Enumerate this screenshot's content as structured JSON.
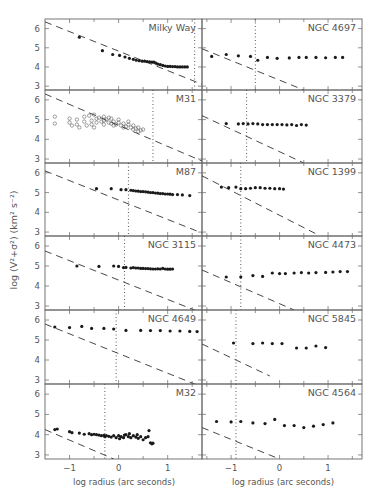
{
  "figure": {
    "ylabel": "log (V²+σ²) (km² s⁻²)",
    "xlabel": "log radius (arc seconds)",
    "frame_color": "#666666",
    "point_color": "#1a1a1a",
    "text_color": "#555555"
  },
  "chart_data": [
    {
      "type": "scatter",
      "title": "Milky Way",
      "column": 0,
      "row": 0,
      "xlim": [
        -1.5,
        1.7
      ],
      "ylim": [
        2.8,
        6.5
      ],
      "dashed_line": [
        [
          -1.5,
          6.35
        ],
        [
          1.7,
          3.1
        ]
      ],
      "dotted_x": 1.55,
      "points": [
        [
          -0.8,
          5.55
        ],
        [
          -0.33,
          4.85
        ],
        [
          -0.12,
          4.65
        ],
        [
          0.02,
          4.6
        ],
        [
          0.13,
          4.52
        ],
        [
          0.22,
          4.45
        ],
        [
          0.3,
          4.4
        ],
        [
          0.36,
          4.35
        ],
        [
          0.42,
          4.33
        ],
        [
          0.48,
          4.3
        ],
        [
          0.53,
          4.3
        ],
        [
          0.58,
          4.28
        ],
        [
          0.63,
          4.27
        ],
        [
          0.68,
          4.25
        ],
        [
          0.72,
          4.25
        ],
        [
          0.76,
          4.2
        ],
        [
          0.8,
          4.15
        ],
        [
          0.85,
          4.12
        ],
        [
          0.9,
          4.08
        ],
        [
          0.95,
          4.05
        ],
        [
          1.0,
          4.03
        ],
        [
          1.05,
          4.03
        ],
        [
          1.1,
          4.02
        ],
        [
          1.15,
          4.02
        ],
        [
          1.2,
          4.0
        ],
        [
          1.25,
          4.0
        ],
        [
          1.3,
          4.0
        ],
        [
          1.35,
          4.0
        ],
        [
          1.4,
          4.0
        ]
      ],
      "open": false
    },
    {
      "type": "scatter",
      "title": "M31",
      "column": 0,
      "row": 1,
      "xlim": [
        -1.5,
        1.7
      ],
      "ylim": [
        2.8,
        6.5
      ],
      "dashed_line": [
        [
          -1.5,
          6.3
        ],
        [
          1.7,
          2.9
        ]
      ],
      "dotted_x": 0.7,
      "points": [
        [
          -1.3,
          5.15
        ],
        [
          -1.3,
          4.8
        ],
        [
          -1.0,
          5.05
        ],
        [
          -1.0,
          4.85
        ],
        [
          -0.95,
          4.7
        ],
        [
          -0.85,
          5.0
        ],
        [
          -0.85,
          4.75
        ],
        [
          -0.8,
          4.6
        ],
        [
          -0.7,
          5.15
        ],
        [
          -0.7,
          4.9
        ],
        [
          -0.65,
          4.7
        ],
        [
          -0.6,
          5.2
        ],
        [
          -0.55,
          4.95
        ],
        [
          -0.55,
          4.75
        ],
        [
          -0.5,
          5.25
        ],
        [
          -0.45,
          5.05
        ],
        [
          -0.45,
          4.85
        ],
        [
          -0.4,
          5.1
        ],
        [
          -0.35,
          4.9
        ],
        [
          -0.3,
          5.15
        ],
        [
          -0.3,
          4.75
        ],
        [
          -0.25,
          5.0
        ],
        [
          -0.2,
          4.85
        ],
        [
          -0.15,
          5.05
        ],
        [
          -0.15,
          4.8
        ],
        [
          -0.1,
          4.9
        ],
        [
          -0.05,
          4.75
        ],
        [
          0.0,
          4.85
        ],
        [
          0.05,
          4.7
        ],
        [
          0.1,
          4.8
        ],
        [
          0.15,
          4.65
        ],
        [
          0.2,
          4.75
        ],
        [
          0.25,
          4.6
        ],
        [
          0.3,
          4.7
        ],
        [
          0.35,
          4.55
        ],
        [
          0.4,
          4.6
        ],
        [
          0.45,
          4.45
        ],
        [
          0.5,
          4.5
        ],
        [
          0.3,
          4.5
        ],
        [
          0.1,
          4.6
        ],
        [
          -0.1,
          4.7
        ],
        [
          -0.3,
          4.95
        ],
        [
          -0.5,
          4.6
        ],
        [
          0.2,
          4.9
        ],
        [
          0.0,
          5.0
        ],
        [
          -0.2,
          5.1
        ],
        [
          0.4,
          4.4
        ]
      ],
      "open": true
    },
    {
      "type": "scatter",
      "title": "M87",
      "column": 0,
      "row": 2,
      "xlim": [
        -1.5,
        1.7
      ],
      "ylim": [
        2.8,
        6.5
      ],
      "dashed_line": [
        [
          -1.5,
          6.1
        ],
        [
          1.7,
          2.95
        ]
      ],
      "dotted_x": 0.2,
      "points": [
        [
          -0.45,
          5.2
        ],
        [
          -0.15,
          5.2
        ],
        [
          0.05,
          5.15
        ],
        [
          0.15,
          5.15
        ],
        [
          0.25,
          5.12
        ],
        [
          0.3,
          5.1
        ],
        [
          0.35,
          5.08
        ],
        [
          0.4,
          5.07
        ],
        [
          0.45,
          5.05
        ],
        [
          0.5,
          5.05
        ],
        [
          0.55,
          5.04
        ],
        [
          0.6,
          5.02
        ],
        [
          0.65,
          5.0
        ],
        [
          0.7,
          5.0
        ],
        [
          0.75,
          4.98
        ],
        [
          0.8,
          4.97
        ],
        [
          0.85,
          4.95
        ],
        [
          0.9,
          4.95
        ],
        [
          0.95,
          4.93
        ],
        [
          1.0,
          4.93
        ],
        [
          1.05,
          4.92
        ],
        [
          1.1,
          4.9
        ],
        [
          1.2,
          4.9
        ],
        [
          1.3,
          4.88
        ],
        [
          1.45,
          4.85
        ]
      ],
      "open": false
    },
    {
      "type": "scatter",
      "title": "NGC 3115",
      "column": 0,
      "row": 3,
      "xlim": [
        -1.5,
        1.7
      ],
      "ylim": [
        2.8,
        6.5
      ],
      "dashed_line": [
        [
          -1.5,
          5.75
        ],
        [
          1.7,
          2.65
        ]
      ],
      "dotted_x": 0.12,
      "points": [
        [
          -0.85,
          5.0
        ],
        [
          -0.4,
          4.98
        ],
        [
          -0.1,
          5.0
        ],
        [
          0.0,
          4.98
        ],
        [
          0.1,
          4.92
        ],
        [
          0.15,
          4.93
        ],
        [
          0.25,
          4.9
        ],
        [
          0.3,
          4.92
        ],
        [
          0.35,
          4.9
        ],
        [
          0.4,
          4.9
        ],
        [
          0.45,
          4.88
        ],
        [
          0.5,
          4.88
        ],
        [
          0.55,
          4.87
        ],
        [
          0.6,
          4.87
        ],
        [
          0.65,
          4.86
        ],
        [
          0.7,
          4.85
        ],
        [
          0.75,
          4.85
        ],
        [
          0.8,
          4.86
        ],
        [
          0.85,
          4.85
        ],
        [
          0.9,
          4.88
        ],
        [
          0.95,
          4.85
        ],
        [
          1.0,
          4.84
        ],
        [
          1.05,
          4.84
        ],
        [
          1.1,
          4.85
        ]
      ],
      "open": false
    },
    {
      "type": "scatter",
      "title": "NGC 4649",
      "column": 0,
      "row": 4,
      "xlim": [
        -1.5,
        1.7
      ],
      "ylim": [
        2.8,
        6.5
      ],
      "dashed_line": [
        [
          -1.5,
          5.8
        ],
        [
          1.7,
          2.65
        ]
      ],
      "dotted_x": -0.05,
      "points": [
        [
          -1.3,
          5.65
        ],
        [
          -1.0,
          5.62
        ],
        [
          -0.75,
          5.68
        ],
        [
          -0.55,
          5.58
        ],
        [
          -0.3,
          5.58
        ],
        [
          -0.1,
          5.55
        ],
        [
          0.15,
          5.48
        ],
        [
          0.45,
          5.48
        ],
        [
          0.65,
          5.47
        ],
        [
          0.85,
          5.47
        ],
        [
          1.05,
          5.45
        ],
        [
          1.25,
          5.45
        ],
        [
          1.45,
          5.43
        ],
        [
          1.6,
          5.42
        ]
      ],
      "open": false
    },
    {
      "type": "scatter",
      "title": "M32",
      "column": 0,
      "row": 5,
      "xlim": [
        -1.5,
        1.7
      ],
      "ylim": [
        2.8,
        6.5
      ],
      "dashed_line": [
        [
          -1.5,
          4.25
        ],
        [
          -0.1,
          2.8
        ]
      ],
      "dotted_x": -0.28,
      "points": [
        [
          -1.3,
          4.25
        ],
        [
          -1.25,
          4.28
        ],
        [
          -1.0,
          4.15
        ],
        [
          -0.95,
          4.1
        ],
        [
          -0.8,
          4.08
        ],
        [
          -0.7,
          4.02
        ],
        [
          -0.6,
          4.05
        ],
        [
          -0.55,
          4.0
        ],
        [
          -0.5,
          4.02
        ],
        [
          -0.45,
          4.0
        ],
        [
          -0.4,
          3.98
        ],
        [
          -0.35,
          3.95
        ],
        [
          -0.3,
          3.97
        ],
        [
          -0.28,
          3.9
        ],
        [
          -0.25,
          3.95
        ],
        [
          -0.2,
          3.92
        ],
        [
          -0.15,
          3.88
        ],
        [
          -0.1,
          3.95
        ],
        [
          -0.05,
          3.85
        ],
        [
          0.0,
          3.95
        ],
        [
          0.02,
          3.8
        ],
        [
          0.05,
          3.9
        ],
        [
          0.1,
          3.85
        ],
        [
          0.12,
          3.98
        ],
        [
          0.15,
          4.0
        ],
        [
          0.2,
          3.9
        ],
        [
          0.22,
          4.05
        ],
        [
          0.25,
          3.85
        ],
        [
          0.3,
          3.95
        ],
        [
          0.35,
          3.88
        ],
        [
          0.38,
          4.0
        ],
        [
          0.4,
          3.82
        ],
        [
          0.45,
          3.9
        ],
        [
          0.5,
          3.75
        ],
        [
          0.55,
          3.85
        ],
        [
          0.6,
          3.9
        ],
        [
          0.62,
          4.2
        ],
        [
          0.65,
          3.6
        ],
        [
          0.68,
          3.55
        ],
        [
          0.7,
          3.58
        ]
      ],
      "open": false
    },
    {
      "type": "scatter",
      "title": "NGC 4697",
      "column": 1,
      "row": 0,
      "xlim": [
        -1.6,
        1.7
      ],
      "ylim": [
        2.8,
        6.5
      ],
      "dashed_line": [
        [
          -1.6,
          4.95
        ],
        [
          0.5,
          2.8
        ]
      ],
      "dotted_x": -0.5,
      "points": [
        [
          -1.4,
          4.55
        ],
        [
          -1.1,
          4.65
        ],
        [
          -0.85,
          4.58
        ],
        [
          -0.6,
          4.55
        ],
        [
          -0.45,
          4.35
        ],
        [
          -0.25,
          4.5
        ],
        [
          -0.05,
          4.45
        ],
        [
          0.2,
          4.47
        ],
        [
          0.4,
          4.5
        ],
        [
          0.55,
          4.5
        ],
        [
          0.75,
          4.5
        ],
        [
          0.95,
          4.48
        ],
        [
          1.15,
          4.5
        ],
        [
          1.3,
          4.5
        ]
      ],
      "open": false
    },
    {
      "type": "scatter",
      "title": "NGC 3379",
      "column": 1,
      "row": 1,
      "xlim": [
        -1.6,
        1.7
      ],
      "ylim": [
        2.8,
        6.5
      ],
      "dashed_line": [
        [
          -1.6,
          5.2
        ],
        [
          0.5,
          2.8
        ]
      ],
      "dotted_x": -0.68,
      "points": [
        [
          -1.1,
          4.8
        ],
        [
          -0.85,
          4.78
        ],
        [
          -0.75,
          4.8
        ],
        [
          -0.65,
          4.78
        ],
        [
          -0.55,
          4.8
        ],
        [
          -0.45,
          4.78
        ],
        [
          -0.35,
          4.75
        ],
        [
          -0.25,
          4.75
        ],
        [
          -0.15,
          4.75
        ],
        [
          -0.05,
          4.75
        ],
        [
          0.05,
          4.75
        ],
        [
          0.15,
          4.73
        ],
        [
          0.25,
          4.75
        ],
        [
          0.35,
          4.7
        ],
        [
          0.45,
          4.75
        ],
        [
          0.55,
          4.72
        ]
      ],
      "open": false
    },
    {
      "type": "scatter",
      "title": "NGC 1399",
      "column": 1,
      "row": 2,
      "xlim": [
        -1.6,
        1.7
      ],
      "ylim": [
        2.8,
        6.5
      ],
      "dashed_line": [
        [
          -1.6,
          5.85
        ],
        [
          0.8,
          2.85
        ]
      ],
      "dotted_x": -0.8,
      "points": [
        [
          -1.2,
          5.28
        ],
        [
          -1.05,
          5.25
        ],
        [
          -0.9,
          5.28
        ],
        [
          -0.8,
          5.2
        ],
        [
          -0.7,
          5.2
        ],
        [
          -0.6,
          5.22
        ],
        [
          -0.5,
          5.25
        ],
        [
          -0.4,
          5.25
        ],
        [
          -0.3,
          5.22
        ],
        [
          -0.2,
          5.22
        ],
        [
          -0.1,
          5.2
        ],
        [
          0.0,
          5.2
        ],
        [
          0.08,
          5.18
        ]
      ],
      "open": false
    },
    {
      "type": "scatter",
      "title": "NGC 4473",
      "column": 1,
      "row": 3,
      "xlim": [
        -1.6,
        1.7
      ],
      "ylim": [
        2.8,
        6.5
      ],
      "dashed_line": [
        [
          -1.6,
          4.8
        ],
        [
          0.3,
          2.8
        ]
      ],
      "dotted_x": -0.8,
      "points": [
        [
          -1.1,
          4.45
        ],
        [
          -0.8,
          4.45
        ],
        [
          -0.55,
          4.52
        ],
        [
          -0.35,
          4.48
        ],
        [
          -0.15,
          4.65
        ],
        [
          0.0,
          4.62
        ],
        [
          0.12,
          4.62
        ],
        [
          0.3,
          4.65
        ],
        [
          0.45,
          4.67
        ],
        [
          0.6,
          4.65
        ],
        [
          0.75,
          4.67
        ],
        [
          0.95,
          4.68
        ],
        [
          1.1,
          4.7
        ],
        [
          1.25,
          4.72
        ],
        [
          1.4,
          4.72
        ]
      ],
      "open": false
    },
    {
      "type": "scatter",
      "title": "NGC 5845",
      "column": 1,
      "row": 4,
      "xlim": [
        -1.6,
        1.7
      ],
      "ylim": [
        2.8,
        6.5
      ],
      "dashed_line": [
        [
          -1.6,
          4.8
        ],
        [
          -0.2,
          3.2
        ]
      ],
      "dotted_x": -0.9,
      "points": [
        [
          -0.95,
          4.85
        ],
        [
          -0.55,
          4.82
        ],
        [
          -0.35,
          4.85
        ],
        [
          -0.15,
          4.82
        ],
        [
          0.05,
          4.82
        ],
        [
          0.35,
          4.6
        ],
        [
          0.55,
          4.6
        ],
        [
          0.75,
          4.7
        ],
        [
          0.95,
          4.62
        ]
      ],
      "open": false
    },
    {
      "type": "scatter",
      "title": "NGC 4564",
      "column": 1,
      "row": 5,
      "xlim": [
        -1.6,
        1.7
      ],
      "ylim": [
        2.8,
        6.5
      ],
      "dashed_line": [
        [
          -1.6,
          4.35
        ],
        [
          0.0,
          2.8
        ]
      ],
      "dotted_x": -0.9,
      "points": [
        [
          -1.3,
          4.65
        ],
        [
          -1.0,
          4.63
        ],
        [
          -0.8,
          4.65
        ],
        [
          -0.55,
          4.58
        ],
        [
          -0.3,
          4.55
        ],
        [
          -0.1,
          4.75
        ],
        [
          0.1,
          4.45
        ],
        [
          0.3,
          4.45
        ],
        [
          0.5,
          4.35
        ],
        [
          0.7,
          4.42
        ],
        [
          0.9,
          4.5
        ],
        [
          1.1,
          4.58
        ]
      ],
      "open": false
    }
  ],
  "axes": {
    "yticks": [
      3,
      4,
      5,
      6
    ],
    "xticks_left": [
      -1,
      0,
      1
    ],
    "xticks_right": [
      -1,
      0,
      1
    ]
  }
}
